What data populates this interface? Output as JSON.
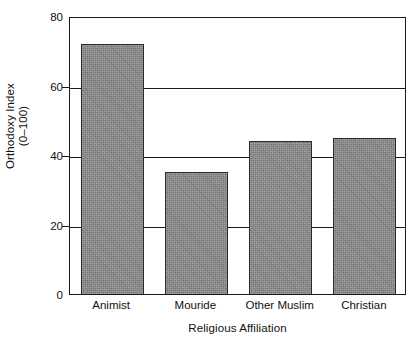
{
  "chart_data": {
    "type": "bar",
    "title": "",
    "subtitle": "",
    "categories": [
      "Animist",
      "Mouride",
      "Other Muslim",
      "Christian"
    ],
    "values": [
      72,
      35,
      44,
      45
    ],
    "xlabel": "Religious Affiliation",
    "ylabel": "Orthodoxy Index (0–100)",
    "ylabel_lines": [
      "Orthodoxy Index",
      "(0–100)"
    ],
    "ylim": [
      0,
      80
    ],
    "yticks": [
      0,
      20,
      40,
      60,
      80
    ],
    "ytick_labels": [
      "0",
      "20",
      "40",
      "60",
      "80"
    ],
    "grid": true,
    "gridlines_at": [
      20,
      40,
      60
    ],
    "legend": null,
    "legend_position": "none",
    "bar_fill_color": "#878787",
    "bar_edge_color": "#2a2a2a",
    "axis_color": "#1a1a1a",
    "background_color": "#ffffff"
  },
  "axes": {
    "y_title_line1": "Orthodoxy Index",
    "y_title_line2": "(0–100)",
    "x_title": "Religious Affiliation"
  },
  "y_ticks": [
    {
      "label": "80",
      "value": 80
    },
    {
      "label": "60",
      "value": 60
    },
    {
      "label": "40",
      "value": 40
    },
    {
      "label": "20",
      "value": 20
    },
    {
      "label": "0",
      "value": 0
    }
  ],
  "bars": [
    {
      "label": "Animist",
      "value": 72
    },
    {
      "label": "Mouride",
      "value": 35
    },
    {
      "label": "Other Muslim",
      "value": 44
    },
    {
      "label": "Christian",
      "value": 45
    }
  ]
}
